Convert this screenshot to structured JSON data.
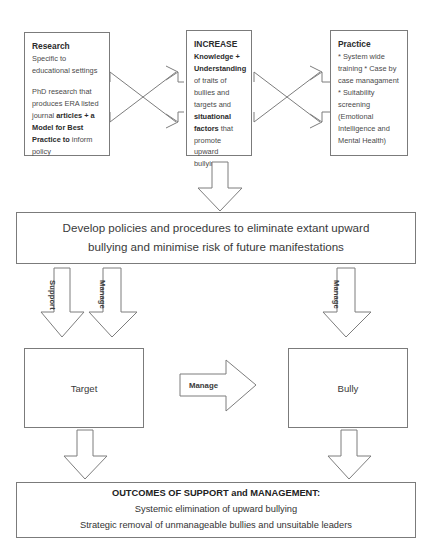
{
  "diagram": {
    "top_boxes": [
      {
        "id": "research",
        "heading": "Research",
        "para1": "Specific to educational settings",
        "para2_pre": "PhD research that produces ERA listed journal ",
        "para2_bold": "articles + a Model for Best Practice to",
        "para2_post": " inform policy"
      },
      {
        "id": "increase",
        "heading": "INCREASE",
        "line_bold1": "Knowledge + Understanding",
        "line_plain1": " of traits of bullies and targets and ",
        "line_bold2": "situational factors",
        "line_plain2": " that promote upward bullying"
      },
      {
        "id": "practice",
        "heading": "Practice",
        "bullets": [
          "* System wide training",
          "* Case by case managament",
          "* Suitability screening (Emotional Intelligence and Mental Health)"
        ]
      }
    ],
    "policy_box": {
      "line1": "Develop policies and procedures to eliminate extant upward",
      "line2": "bullying and minimise risk of future manifestations"
    },
    "arrow_labels": {
      "support": "Support",
      "manage_target": "Manage",
      "manage_bully": "Manage",
      "manage_middle": "Manage"
    },
    "actors": {
      "target": "Target",
      "bully": "Bully"
    },
    "outcomes_box": {
      "title": "OUTCOMES OF SUPPORT and MANAGEMENT:",
      "line1": "Systemic elimination of upward bullying",
      "line2": "Strategic removal of unmanageable bullies and unsuitable leaders"
    },
    "colors": {
      "stroke": "#7b7b7b",
      "text": "#3a3a3a",
      "background": "#ffffff"
    }
  }
}
